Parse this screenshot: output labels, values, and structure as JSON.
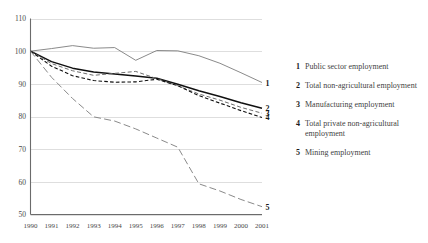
{
  "chart_data": {
    "type": "line",
    "title": "",
    "xlabel": "",
    "ylabel": "",
    "grid": true,
    "legend_position": "right",
    "x": [
      1990,
      1991,
      1992,
      1993,
      1994,
      1995,
      1996,
      1997,
      1998,
      1999,
      2000,
      2001
    ],
    "xticklabels": [
      "1990",
      "1991",
      "1992",
      "1993",
      "1994",
      "1995",
      "1996",
      "1997",
      "1998",
      "1999",
      "2000",
      "2001"
    ],
    "yticklabels": [
      "110",
      "100",
      "90",
      "80",
      "70",
      "60",
      "50"
    ],
    "yticks": [
      110,
      100,
      90,
      80,
      70,
      60,
      50
    ],
    "ylim": [
      50,
      110
    ],
    "xlim": [
      1990,
      2001
    ],
    "series": [
      {
        "id": 1,
        "name": "Public sector employment",
        "end_label": "1",
        "style": "solid-grey",
        "values": [
          100,
          100.8,
          101.7,
          100.9,
          101.1,
          97.2,
          100.2,
          100.1,
          98.6,
          96.3,
          93.4,
          90.4
        ]
      },
      {
        "id": 2,
        "name": "Total non-agricultural employment",
        "end_label": "2",
        "style": "solid-black",
        "values": [
          100,
          96.8,
          94.8,
          93.6,
          93.0,
          92.4,
          91.7,
          89.9,
          87.9,
          86.1,
          84.2,
          82.5
        ]
      },
      {
        "id": 3,
        "name": "Manufacturing employment",
        "end_label": "3",
        "style": "dashed-grey",
        "values": [
          100,
          96.2,
          94.0,
          92.6,
          93.2,
          93.8,
          91.6,
          89.4,
          86.9,
          85.0,
          82.8,
          81.0
        ]
      },
      {
        "id": 4,
        "name": "Total private non-agricultural employment",
        "end_label": "4",
        "style": "dashed-black",
        "values": [
          100,
          95.4,
          92.5,
          91.0,
          90.5,
          90.6,
          91.4,
          89.4,
          86.4,
          84.1,
          81.8,
          79.7
        ]
      },
      {
        "id": 5,
        "name": "Mining employment",
        "end_label": "5",
        "style": "long-dashed-grey",
        "values": [
          100,
          92.0,
          85.5,
          79.9,
          78.6,
          76.2,
          73.4,
          70.6,
          59.4,
          57.2,
          54.6,
          52.4
        ]
      }
    ]
  },
  "legend": {
    "items": [
      {
        "num": "1",
        "label": "Public sector employment"
      },
      {
        "num": "2",
        "label": "Total non-agricultural employment"
      },
      {
        "num": "3",
        "label": "Manufacturing employment"
      },
      {
        "num": "4",
        "label": "Total private non-agricultural employment"
      },
      {
        "num": "5",
        "label": "Mining employment"
      }
    ]
  }
}
